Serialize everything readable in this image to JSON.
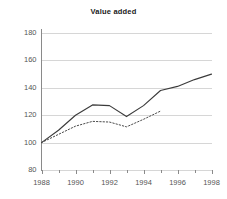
{
  "chart_data": {
    "type": "line",
    "title": "Value added",
    "xlabel": "",
    "ylabel": "",
    "xlim": [
      1988,
      1998
    ],
    "ylim": [
      80,
      180
    ],
    "ytick_labels": [
      "80",
      "100",
      "120",
      "140",
      "160",
      "180"
    ],
    "ytick_values": [
      80,
      100,
      120,
      140,
      160,
      180
    ],
    "xtick_labels": [
      "1988",
      "1990",
      "1992",
      "1994",
      "1996",
      "1998"
    ],
    "xtick_values": [
      1988,
      1990,
      1992,
      1994,
      1996,
      1998
    ],
    "minor_xticks": [
      1989,
      1991,
      1993,
      1995,
      1997
    ],
    "grid": "horizontal",
    "legend": "none",
    "series": [
      {
        "name": "solid-series",
        "style": "solid",
        "color": "#3b3b3b",
        "x": [
          1988,
          1989,
          1990,
          1991,
          1992,
          1993,
          1994,
          1995,
          1996,
          1997,
          1998
        ],
        "values": [
          100,
          109,
          120,
          127.5,
          127,
          119,
          127,
          138,
          141,
          146,
          150
        ]
      },
      {
        "name": "dotted-series",
        "style": "dotted",
        "color": "#4a4a4a",
        "x": [
          1988,
          1989,
          1990,
          1991,
          1992,
          1993,
          1994,
          1995
        ],
        "values": [
          100,
          106,
          112,
          115.5,
          115,
          111.5,
          117,
          123
        ]
      }
    ]
  },
  "axes": {
    "axis_color": "#8a8a8a",
    "grid_color": "#d6d6d6",
    "tick_text_color": "#555555"
  }
}
